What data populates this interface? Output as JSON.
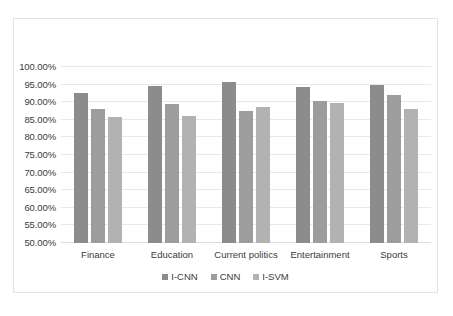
{
  "chart_data": {
    "type": "bar",
    "title": "",
    "subtitle": "",
    "xlabel": "",
    "ylabel": "",
    "categories": [
      "Finance",
      "Education",
      "Current politics",
      "Entertainment",
      "Sports"
    ],
    "series": [
      {
        "name": "I-CNN",
        "color": "#8c8c8c",
        "values": [
          92.5,
          94.7,
          95.7,
          94.4,
          94.8
        ]
      },
      {
        "name": "CNN",
        "color": "#9d9d9d",
        "values": [
          88.2,
          89.5,
          87.5,
          90.4,
          92.1
        ]
      },
      {
        "name": "I-SVM",
        "color": "#b2b2b2",
        "values": [
          85.8,
          86.0,
          88.6,
          89.7,
          88.1
        ]
      }
    ],
    "ylim": [
      50,
      100
    ],
    "ytick_values": [
      50,
      55,
      60,
      65,
      70,
      75,
      80,
      85,
      90,
      95,
      100
    ],
    "ytick_labels": [
      "50.00%",
      "55.00%",
      "60.00%",
      "65.00%",
      "70.00%",
      "75.00%",
      "80.00%",
      "85.00%",
      "90.00%",
      "95.00%",
      "100.00%"
    ],
    "grid": true,
    "legend_position": "bottom",
    "legend_entries": [
      "I-CNN",
      "CNN",
      "I-SVM"
    ]
  }
}
